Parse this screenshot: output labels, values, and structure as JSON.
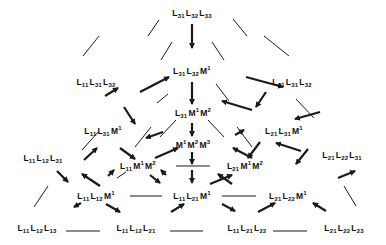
{
  "diagram": {
    "type": "lattice/triangle of transformations",
    "colors": {
      "line": "#1a1a1a",
      "text": "#111111",
      "background": "#ffffff"
    },
    "nodes": [
      {
        "id": "n_L31L32L33",
        "label": "L31 L32 L33",
        "terms": [
          {
            "s": "L",
            "sub": "31"
          },
          {
            "s": "L",
            "sub": "32"
          },
          {
            "s": "L",
            "sub": "33"
          }
        ],
        "x": 192,
        "y": 14
      },
      {
        "id": "n_L31L32M1",
        "label": "L31 L32 M1",
        "terms": [
          {
            "s": "L",
            "sub": "31"
          },
          {
            "s": "L",
            "sub": "32"
          },
          {
            "s": "M",
            "sup": "1"
          }
        ],
        "x": 192,
        "y": 71
      },
      {
        "id": "n_L11L31L32",
        "label": "L11 L31 L32",
        "terms": [
          {
            "s": "L",
            "sub": "11"
          },
          {
            "s": "L",
            "sub": "31"
          },
          {
            "s": "L",
            "sub": "32"
          }
        ],
        "x": 96,
        "y": 83
      },
      {
        "id": "n_L21L31L32",
        "label": "L21 L31 L32",
        "terms": [
          {
            "s": "L",
            "sub": "21"
          },
          {
            "s": "L",
            "sub": "31"
          },
          {
            "s": "L",
            "sub": "32"
          }
        ],
        "x": 292,
        "y": 83
      },
      {
        "id": "n_L31M1M2",
        "label": "L31 M1 M2",
        "terms": [
          {
            "s": "L",
            "sub": "31"
          },
          {
            "s": "M",
            "sup": "1"
          },
          {
            "s": "M",
            "sup": "2"
          }
        ],
        "x": 193,
        "y": 113
      },
      {
        "id": "n_L11L31M1",
        "label": "L11 L31 M1",
        "terms": [
          {
            "s": "L",
            "sub": "11"
          },
          {
            "s": "L",
            "sub": "31"
          },
          {
            "s": "M",
            "sup": "1"
          }
        ],
        "x": 103,
        "y": 131
      },
      {
        "id": "n_L21L31M1",
        "label": "L21 L31 M1",
        "terms": [
          {
            "s": "L",
            "sub": "21"
          },
          {
            "s": "L",
            "sub": "31"
          },
          {
            "s": "M",
            "sup": "1"
          }
        ],
        "x": 284,
        "y": 131
      },
      {
        "id": "n_M1M2M3",
        "label": "M1 M2 M3",
        "terms": [
          {
            "s": "M",
            "sup": "1"
          },
          {
            "s": "M",
            "sup": "2"
          },
          {
            "s": "M",
            "sup": "3"
          }
        ],
        "x": 193,
        "y": 144
      },
      {
        "id": "n_L11L12L31",
        "label": "L11 L12 L31",
        "terms": [
          {
            "s": "L",
            "sub": "11"
          },
          {
            "s": "L",
            "sub": "12"
          },
          {
            "s": "L",
            "sub": "31"
          }
        ],
        "x": 43,
        "y": 159
      },
      {
        "id": "n_L21L22L31",
        "label": "L21 L22 L31",
        "terms": [
          {
            "s": "L",
            "sub": "21"
          },
          {
            "s": "L",
            "sub": "22"
          },
          {
            "s": "L",
            "sub": "31"
          }
        ],
        "x": 342,
        "y": 156
      },
      {
        "id": "n_L11M1M2",
        "label": "L11 M1 M2",
        "terms": [
          {
            "s": "L",
            "sub": "11"
          },
          {
            "s": "M",
            "sup": "1"
          },
          {
            "s": "M",
            "sup": "2"
          }
        ],
        "x": 138,
        "y": 166
      },
      {
        "id": "n_L21M1M2",
        "label": "L21 M1 M2",
        "terms": [
          {
            "s": "L",
            "sub": "21"
          },
          {
            "s": "M",
            "sup": "1"
          },
          {
            "s": "M",
            "sup": "2"
          }
        ],
        "x": 245,
        "y": 166
      },
      {
        "id": "n_L11L12M1",
        "label": "L11 L12 M1",
        "terms": [
          {
            "s": "L",
            "sub": "11"
          },
          {
            "s": "L",
            "sub": "12"
          },
          {
            "s": "M",
            "sup": "1"
          }
        ],
        "x": 96,
        "y": 196
      },
      {
        "id": "n_L11L21M1",
        "label": "L11 L21 M1",
        "terms": [
          {
            "s": "L",
            "sub": "11"
          },
          {
            "s": "L",
            "sub": "21"
          },
          {
            "s": "M",
            "sup": "1"
          }
        ],
        "x": 192,
        "y": 196
      },
      {
        "id": "n_L21L22M1",
        "label": "L21 L22 M1",
        "terms": [
          {
            "s": "L",
            "sub": "21"
          },
          {
            "s": "L",
            "sub": "22"
          },
          {
            "s": "M",
            "sup": "1"
          }
        ],
        "x": 288,
        "y": 196
      },
      {
        "id": "n_L11L12L13",
        "label": "L11 L12 L13",
        "terms": [
          {
            "s": "L",
            "sub": "11"
          },
          {
            "s": "L",
            "sub": "12"
          },
          {
            "s": "L",
            "sub": "13"
          }
        ],
        "x": 37,
        "y": 229
      },
      {
        "id": "n_L11L12L21",
        "label": "L11 L12 L21",
        "terms": [
          {
            "s": "L",
            "sub": "11"
          },
          {
            "s": "L",
            "sub": "12"
          },
          {
            "s": "L",
            "sub": "21"
          }
        ],
        "x": 136,
        "y": 229
      },
      {
        "id": "n_L11L21L22",
        "label": "L11 L21 L22",
        "terms": [
          {
            "s": "L",
            "sub": "11"
          },
          {
            "s": "L",
            "sub": "21"
          },
          {
            "s": "L",
            "sub": "22"
          }
        ],
        "x": 247,
        "y": 229
      },
      {
        "id": "n_L21L22L23",
        "label": "L21 L22 L23",
        "terms": [
          {
            "s": "L",
            "sub": "21"
          },
          {
            "s": "L",
            "sub": "22"
          },
          {
            "s": "L",
            "sub": "23"
          }
        ],
        "x": 344,
        "y": 229
      }
    ],
    "arrows": [
      {
        "from": [
          192,
          24
        ],
        "to": [
          192,
          48
        ]
      },
      {
        "from": [
          192,
          82
        ],
        "to": [
          192,
          104
        ]
      },
      {
        "from": [
          192,
          123
        ],
        "to": [
          192,
          136
        ]
      },
      {
        "from": [
          192,
          152
        ],
        "to": [
          192,
          164
        ]
      },
      {
        "from": [
          192,
          170
        ],
        "to": [
          192,
          183
        ]
      },
      {
        "from": [
          118,
          88
        ],
        "to": [
          105,
          96
        ],
        "reverse": true
      },
      {
        "from": [
          140,
          92
        ],
        "to": [
          169,
          77
        ]
      },
      {
        "from": [
          246,
          77
        ],
        "to": [
          283,
          87
        ],
        "reverse": false
      },
      {
        "from": [
          266,
          92
        ],
        "to": [
          256,
          107
        ]
      },
      {
        "from": [
          124,
          107
        ],
        "to": [
          135,
          124
        ]
      },
      {
        "from": [
          146,
          138
        ],
        "to": [
          163,
          132
        ],
        "reverse": true
      },
      {
        "from": [
          252,
          110
        ],
        "to": [
          222,
          101
        ],
        "reverse": false
      },
      {
        "from": [
          235,
          135
        ],
        "to": [
          244,
          130
        ]
      },
      {
        "from": [
          276,
          143
        ],
        "to": [
          301,
          151
        ],
        "reverse": true
      },
      {
        "from": [
          260,
          142
        ],
        "to": [
          248,
          158
        ]
      },
      {
        "from": [
          120,
          148
        ],
        "to": [
          135,
          159
        ]
      },
      {
        "from": [
          97,
          148
        ],
        "to": [
          84,
          160
        ],
        "reverse": true
      },
      {
        "from": [
          155,
          158
        ],
        "to": [
          178,
          148
        ]
      },
      {
        "from": [
          233,
          148
        ],
        "to": [
          252,
          158
        ],
        "reverse": true
      },
      {
        "from": [
          295,
          119
        ],
        "to": [
          320,
          112
        ],
        "reverse": true
      },
      {
        "from": [
          338,
          178
        ],
        "to": [
          355,
          171
        ]
      },
      {
        "from": [
          82,
          174
        ],
        "to": [
          100,
          186
        ],
        "reverse": true
      },
      {
        "from": [
          108,
          176
        ],
        "to": [
          114,
          170
        ]
      },
      {
        "from": [
          150,
          175
        ],
        "to": [
          160,
          183
        ]
      },
      {
        "from": [
          166,
          175
        ],
        "to": [
          161,
          170
        ]
      },
      {
        "from": [
          210,
          184
        ],
        "to": [
          232,
          175
        ]
      },
      {
        "from": [
          218,
          174
        ],
        "to": [
          232,
          184
        ],
        "reverse": true
      },
      {
        "from": [
          308,
          149
        ],
        "to": [
          296,
          164
        ]
      },
      {
        "from": [
          57,
          171
        ],
        "to": [
          68,
          182
        ]
      },
      {
        "from": [
          74,
          207
        ],
        "to": [
          81,
          203
        ],
        "reverse": true
      },
      {
        "from": [
          120,
          212
        ],
        "to": [
          106,
          204
        ],
        "reverse": true
      },
      {
        "from": [
          171,
          212
        ],
        "to": [
          184,
          204
        ]
      },
      {
        "from": [
          222,
          204
        ],
        "to": [
          235,
          211
        ]
      },
      {
        "from": [
          258,
          212
        ],
        "to": [
          275,
          203
        ]
      },
      {
        "from": [
          313,
          203
        ],
        "to": [
          326,
          211
        ],
        "reverse": true
      }
    ],
    "lines": [
      {
        "x1": 148,
        "y1": 36,
        "x2": 159,
        "y2": 20
      },
      {
        "x1": 233,
        "y1": 19,
        "x2": 247,
        "y2": 36
      },
      {
        "x1": 83,
        "y1": 56,
        "x2": 99,
        "y2": 36
      },
      {
        "x1": 264,
        "y1": 36,
        "x2": 289,
        "y2": 56
      },
      {
        "x1": 157,
        "y1": 103,
        "x2": 168,
        "y2": 94
      },
      {
        "x1": 216,
        "y1": 84,
        "x2": 229,
        "y2": 101
      },
      {
        "x1": 82,
        "y1": 150,
        "x2": 99,
        "y2": 131
      },
      {
        "x1": 296,
        "y1": 99,
        "x2": 314,
        "y2": 118
      },
      {
        "x1": 160,
        "y1": 137,
        "x2": 176,
        "y2": 120
      },
      {
        "x1": 208,
        "y1": 120,
        "x2": 224,
        "y2": 137
      },
      {
        "x1": 34,
        "y1": 207,
        "x2": 48,
        "y2": 186
      },
      {
        "x1": 344,
        "y1": 186,
        "x2": 356,
        "y2": 206
      },
      {
        "x1": 117,
        "y1": 178,
        "x2": 126,
        "y2": 172
      },
      {
        "x1": 176,
        "y1": 166,
        "x2": 210,
        "y2": 166
      },
      {
        "x1": 130,
        "y1": 196,
        "x2": 162,
        "y2": 196
      },
      {
        "x1": 222,
        "y1": 196,
        "x2": 256,
        "y2": 196
      },
      {
        "x1": 66,
        "y1": 231,
        "x2": 100,
        "y2": 231
      },
      {
        "x1": 170,
        "y1": 231,
        "x2": 203,
        "y2": 231
      },
      {
        "x1": 273,
        "y1": 231,
        "x2": 307,
        "y2": 231
      },
      {
        "x1": 135,
        "y1": 147,
        "x2": 151,
        "y2": 127
      },
      {
        "x1": 237,
        "y1": 127,
        "x2": 252,
        "y2": 147
      },
      {
        "x1": 161,
        "y1": 60,
        "x2": 172,
        "y2": 42
      },
      {
        "x1": 212,
        "y1": 42,
        "x2": 224,
        "y2": 60
      }
    ]
  }
}
